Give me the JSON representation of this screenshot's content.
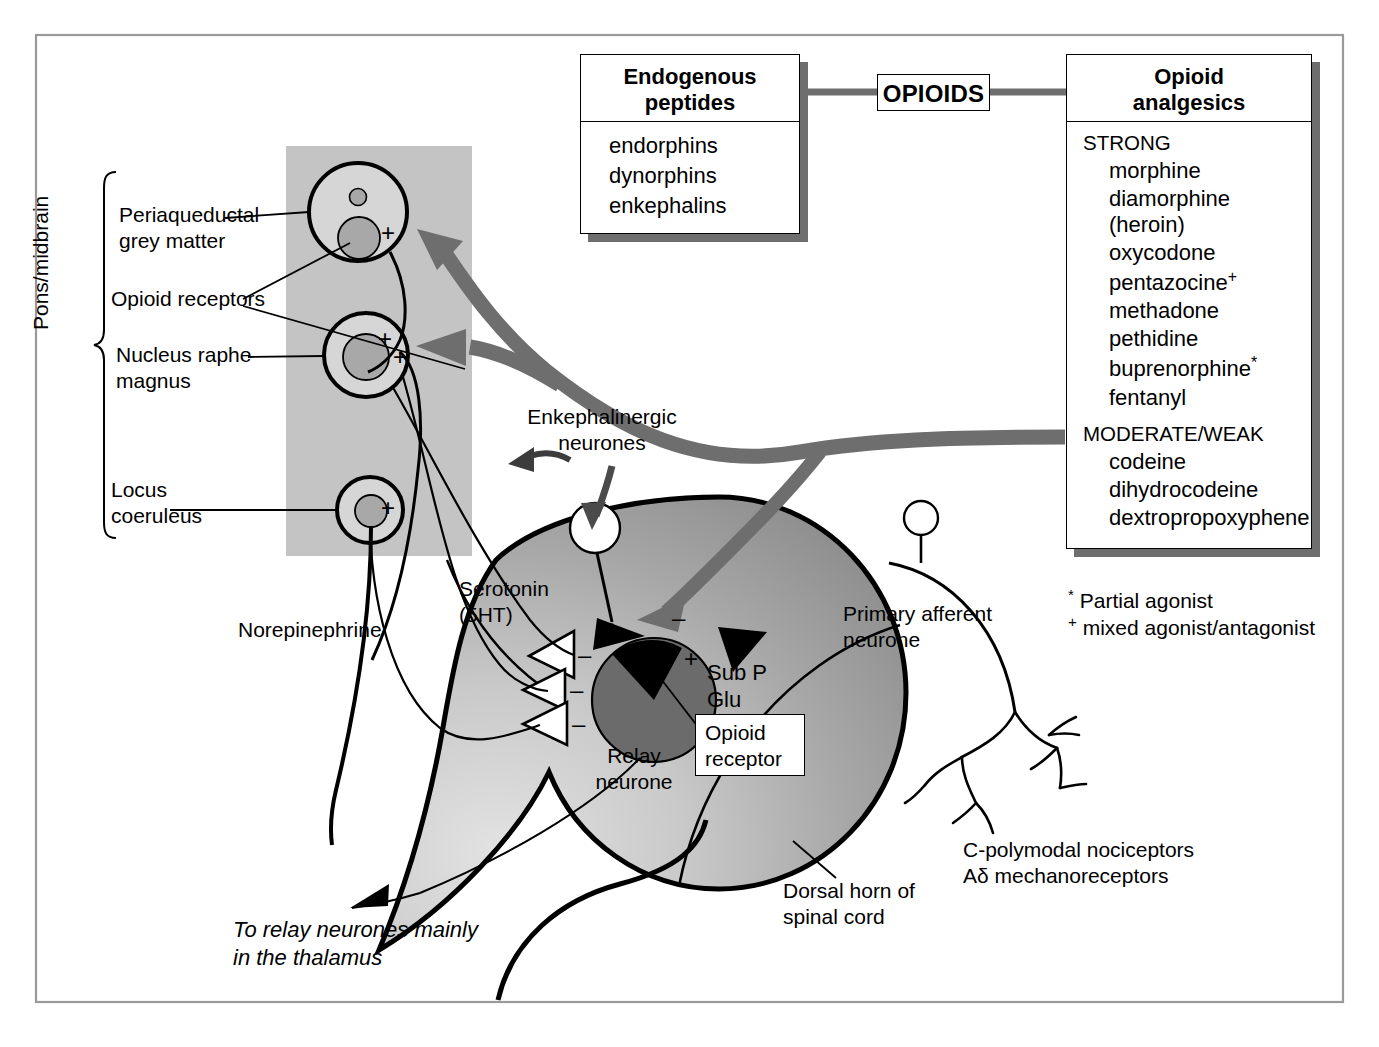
{
  "figure": {
    "title_hidden": "Opioid analgesia pathway",
    "outer_frame_color": "#9a9a9a",
    "grey_band_color": "#c4c4c4",
    "arrow_grey": "#6e6e6e"
  },
  "hub": {
    "label": "OPIOIDS"
  },
  "endogenous_box": {
    "header_line1": "Endogenous",
    "header_line2": "peptides",
    "items": [
      "endorphins",
      "dynorphins",
      "enkephalins"
    ]
  },
  "analgesics_box": {
    "header_line1": "Opioid",
    "header_line2": "analgesics",
    "groups": [
      {
        "heading": "STRONG",
        "items": [
          "morphine",
          "diamorphine (heroin)",
          "oxycodone",
          "pentazocine",
          "methadone",
          "pethidine",
          "buprenorphine",
          "fentanyl"
        ],
        "marks": [
          "",
          "",
          "",
          "+",
          "",
          "",
          "*",
          ""
        ]
      },
      {
        "heading": "MODERATE/WEAK",
        "items": [
          "codeine",
          "dihydrocodeine",
          "dextropropoxyphene"
        ],
        "marks": [
          "",
          "",
          ""
        ]
      }
    ]
  },
  "footnotes": [
    {
      "mark": "*",
      "text": "Partial agonist"
    },
    {
      "mark": "+",
      "text": "mixed agonist/antagonist"
    }
  ],
  "brain_region": {
    "bracket_label": "Pons/midbrain",
    "structures": [
      {
        "name": "Periaqueductal",
        "name2": "grey matter"
      },
      {
        "name": "Nucleus raphe",
        "name2": "magnus"
      },
      {
        "name": "Locus",
        "name2": "coeruleus"
      }
    ],
    "receptor_label": "Opioid receptors",
    "plus_signs": [
      "+",
      "+",
      "+"
    ]
  },
  "dorsal_horn": {
    "label_line1": "Dorsal horn of",
    "label_line2": "spinal cord",
    "relay_line1": "Relay",
    "relay_line2": "neurone",
    "opioid_receptor_line1": "Opioid",
    "opioid_receptor_line2": "receptor",
    "transmitters_line1": "Sub P",
    "transmitters_line2": "Glu",
    "enkephalinergic_line1": "Enkephalinergic",
    "enkephalinergic_line2": "neurones",
    "serotonin_line1": "Serotonin",
    "serotonin_line2": "(5HT)",
    "norepinephrine": "Norepinephrine",
    "signs": {
      "minus": "–",
      "plus": "+"
    }
  },
  "afferent": {
    "label_line1": "Primary afferent",
    "label_line2": "neurone",
    "receptors_line1": "C-polymodal nociceptors",
    "receptors_line2": "Aδ mechanoreceptors"
  },
  "output": {
    "line1": "To relay neurones mainly",
    "line2": "in the thalamus"
  }
}
